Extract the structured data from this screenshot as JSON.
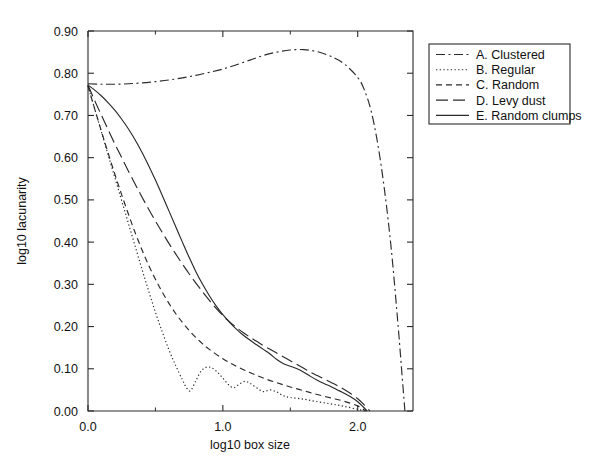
{
  "chart_data": {
    "type": "line",
    "title": "",
    "xlabel": "log10 box size",
    "ylabel": "log10 lacunarity",
    "xlim": [
      0.0,
      2.41
    ],
    "ylim": [
      0.0,
      0.9
    ],
    "grid": false,
    "legend_position": "right-outside",
    "xticks": [
      0.0,
      1.0,
      2.0
    ],
    "xtick_labels": [
      "0.0",
      "1.0",
      "2.0"
    ],
    "xticks_minor": [
      0.5,
      1.5
    ],
    "yticks": [
      0.0,
      0.1,
      0.2,
      0.3,
      0.4,
      0.5,
      0.6,
      0.7,
      0.8,
      0.9
    ],
    "ytick_labels": [
      "0.00",
      "0.10",
      "0.20",
      "0.30",
      "0.40",
      "0.50",
      "0.60",
      "0.70",
      "0.80",
      "0.90"
    ],
    "series": [
      {
        "name": "A. Clustered",
        "key": "clustered",
        "dash": "dashdot",
        "dasharray": "9,3.5,2,3.5",
        "x": [
          0.0,
          0.1,
          0.2,
          0.3,
          0.4,
          0.5,
          0.6,
          0.7,
          0.8,
          0.9,
          1.0,
          1.1,
          1.2,
          1.3,
          1.4,
          1.5,
          1.6,
          1.7,
          1.8,
          1.9,
          2.0,
          2.05,
          2.1,
          2.15,
          2.2,
          2.25,
          2.3,
          2.33,
          2.35
        ],
        "y": [
          0.775,
          0.774,
          0.774,
          0.775,
          0.777,
          0.78,
          0.784,
          0.789,
          0.795,
          0.802,
          0.81,
          0.82,
          0.831,
          0.842,
          0.85,
          0.855,
          0.856,
          0.851,
          0.84,
          0.822,
          0.79,
          0.76,
          0.71,
          0.63,
          0.52,
          0.38,
          0.2,
          0.08,
          0.0
        ]
      },
      {
        "name": "B. Regular",
        "key": "regular",
        "dash": "dotted",
        "dasharray": "1.3,2.4",
        "x": [
          0.0,
          0.05,
          0.1,
          0.15,
          0.2,
          0.25,
          0.3,
          0.35,
          0.4,
          0.45,
          0.5,
          0.55,
          0.6,
          0.65,
          0.7,
          0.73,
          0.76,
          0.8,
          0.84,
          0.88,
          0.92,
          0.96,
          1.0,
          1.04,
          1.08,
          1.12,
          1.16,
          1.2,
          1.25,
          1.3,
          1.35,
          1.4,
          1.45,
          1.5,
          1.6,
          1.7,
          1.8,
          1.9,
          2.0,
          2.05
        ],
        "y": [
          0.77,
          0.715,
          0.66,
          0.606,
          0.552,
          0.498,
          0.444,
          0.39,
          0.336,
          0.284,
          0.234,
          0.188,
          0.145,
          0.108,
          0.074,
          0.055,
          0.048,
          0.072,
          0.095,
          0.104,
          0.102,
          0.092,
          0.078,
          0.063,
          0.055,
          0.063,
          0.07,
          0.066,
          0.055,
          0.046,
          0.05,
          0.045,
          0.036,
          0.032,
          0.028,
          0.022,
          0.017,
          0.011,
          0.004,
          0.0
        ]
      },
      {
        "name": "C. Random",
        "key": "random",
        "dash": "dashed-short",
        "dasharray": "6,4",
        "x": [
          0.0,
          0.05,
          0.1,
          0.15,
          0.2,
          0.25,
          0.3,
          0.35,
          0.4,
          0.45,
          0.5,
          0.55,
          0.6,
          0.65,
          0.7,
          0.75,
          0.8,
          0.85,
          0.9,
          1.0,
          1.1,
          1.2,
          1.3,
          1.4,
          1.5,
          1.6,
          1.7,
          1.8,
          1.9,
          2.0,
          2.06
        ],
        "y": [
          0.77,
          0.715,
          0.662,
          0.61,
          0.56,
          0.512,
          0.466,
          0.422,
          0.382,
          0.345,
          0.312,
          0.282,
          0.255,
          0.231,
          0.21,
          0.191,
          0.174,
          0.159,
          0.146,
          0.124,
          0.106,
          0.091,
          0.078,
          0.067,
          0.057,
          0.048,
          0.039,
          0.031,
          0.023,
          0.012,
          0.0
        ]
      },
      {
        "name": "D. Levy dust",
        "key": "levy-dust",
        "dash": "dashed-long",
        "dasharray": "12,5",
        "x": [
          0.0,
          0.05,
          0.1,
          0.15,
          0.2,
          0.25,
          0.3,
          0.35,
          0.4,
          0.45,
          0.5,
          0.55,
          0.6,
          0.65,
          0.7,
          0.75,
          0.8,
          0.85,
          0.9,
          0.95,
          1.0,
          1.05,
          1.1,
          1.15,
          1.2,
          1.25,
          1.3,
          1.35,
          1.4,
          1.45,
          1.5,
          1.55,
          1.6,
          1.65,
          1.7,
          1.75,
          1.8,
          1.85,
          1.9,
          1.95,
          2.0,
          2.05,
          2.09
        ],
        "y": [
          0.772,
          0.735,
          0.7,
          0.666,
          0.632,
          0.6,
          0.568,
          0.537,
          0.507,
          0.478,
          0.45,
          0.423,
          0.397,
          0.372,
          0.348,
          0.325,
          0.303,
          0.282,
          0.262,
          0.243,
          0.226,
          0.211,
          0.198,
          0.186,
          0.175,
          0.165,
          0.155,
          0.146,
          0.137,
          0.128,
          0.119,
          0.11,
          0.101,
          0.092,
          0.084,
          0.076,
          0.068,
          0.06,
          0.051,
          0.041,
          0.029,
          0.014,
          0.0
        ]
      },
      {
        "name": "E. Random clumps",
        "key": "random-clumps",
        "dash": "solid",
        "dasharray": "",
        "x": [
          0.0,
          0.05,
          0.1,
          0.15,
          0.2,
          0.25,
          0.3,
          0.35,
          0.4,
          0.45,
          0.5,
          0.55,
          0.6,
          0.65,
          0.7,
          0.75,
          0.8,
          0.85,
          0.9,
          0.95,
          1.0,
          1.05,
          1.1,
          1.15,
          1.2,
          1.25,
          1.3,
          1.35,
          1.4,
          1.45,
          1.5,
          1.55,
          1.6,
          1.65,
          1.7,
          1.75,
          1.8,
          1.85,
          1.9,
          1.95,
          2.0,
          2.04,
          2.07
        ],
        "y": [
          0.772,
          0.76,
          0.746,
          0.73,
          0.712,
          0.691,
          0.668,
          0.642,
          0.613,
          0.581,
          0.547,
          0.511,
          0.474,
          0.437,
          0.4,
          0.364,
          0.33,
          0.3,
          0.273,
          0.249,
          0.228,
          0.21,
          0.194,
          0.18,
          0.168,
          0.157,
          0.146,
          0.135,
          0.122,
          0.112,
          0.106,
          0.1,
          0.092,
          0.082,
          0.073,
          0.065,
          0.058,
          0.05,
          0.042,
          0.033,
          0.022,
          0.01,
          0.0
        ]
      }
    ]
  },
  "legend": {
    "items": [
      {
        "label": "A. Clustered"
      },
      {
        "label": "B. Regular"
      },
      {
        "label": "C. Random"
      },
      {
        "label": "D. Levy dust"
      },
      {
        "label": "E. Random clumps"
      }
    ]
  }
}
